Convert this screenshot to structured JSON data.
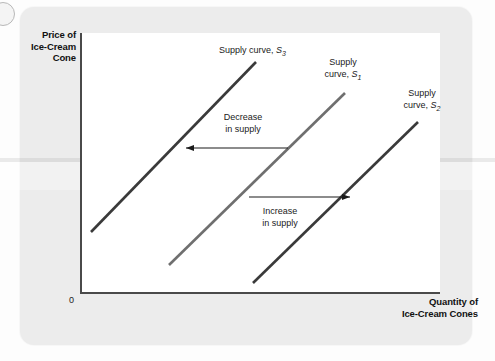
{
  "figure": {
    "type": "economics-supply-shift-diagram",
    "axes": {
      "y_label_lines": [
        "Price of",
        "Ice-Cream",
        "Cone"
      ],
      "x_label_lines": [
        "Quantity of",
        "Ice-Cream Cones"
      ],
      "origin_label": "0"
    },
    "curve_labels": {
      "s3": {
        "text": "Supply curve, ",
        "symbol": "S",
        "subscript": "3"
      },
      "s1_line1": "Supply",
      "s1_line2": {
        "text": "curve, ",
        "symbol": "S",
        "subscript": "1"
      },
      "s2_line1": "Supply",
      "s2_line2": {
        "text": "curve, ",
        "symbol": "S",
        "subscript": "2"
      }
    },
    "annotations": {
      "decrease_line1": "Decrease",
      "decrease_line2": "in supply",
      "increase_line1": "Increase",
      "increase_line2": "in supply"
    },
    "colors": {
      "curve_dark": "#3a3a3a",
      "curve_mid": "#6f6f6f",
      "axis": "#4a4a4a",
      "plot_background": "#ffffff",
      "card_background": "#ececec",
      "text": "#111111"
    }
  },
  "chart_data": {
    "type": "line",
    "title": "",
    "xlabel": "Quantity of Ice-Cream Cones",
    "ylabel": "Price of Ice-Cream Cone",
    "grid": false,
    "legend_position": "inline-curve-labels",
    "axis_note": "Qualitative axes with no numeric tick labels; origin marked 0",
    "series": [
      {
        "name": "Supply curve, S3",
        "label": "S3",
        "color": "#3a3a3a",
        "shift": "decrease in supply (leftward)",
        "x": [
          91,
          256
        ],
        "y": [
          232,
          62
        ]
      },
      {
        "name": "Supply curve, S1",
        "label": "S1",
        "color": "#6f6f6f",
        "shift": "original supply curve",
        "x": [
          169,
          345
        ],
        "y": [
          265,
          93
        ]
      },
      {
        "name": "Supply curve, S2",
        "label": "S2",
        "color": "#3a3a3a",
        "shift": "increase in supply (rightward)",
        "x": [
          253,
          418
        ],
        "y": [
          283,
          122
        ]
      }
    ],
    "arrows": [
      {
        "name": "decrease-in-supply-arrow",
        "direction": "left",
        "from_curve": "S1",
        "to_curve": "S3",
        "x_start": 288,
        "x_end": 186,
        "y": 148,
        "label": "Decrease in supply"
      },
      {
        "name": "increase-in-supply-arrow",
        "direction": "right",
        "from_curve": "S1",
        "to_curve": "S2",
        "x_start": 249,
        "x_end": 350,
        "y": 197,
        "label": "Increase in supply"
      }
    ]
  }
}
